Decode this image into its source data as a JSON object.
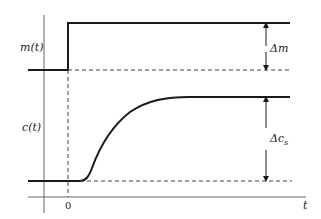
{
  "diagram": {
    "title": "",
    "type": "step-response",
    "colors": {
      "ink": "#1a1a1a",
      "axis": "#555555",
      "dash": "#444444",
      "background": "#ffffff"
    },
    "axes": {
      "x_label": "t",
      "origin_tick_label": "0"
    },
    "signals": [
      {
        "name": "input",
        "label": "m(t)",
        "shape": "step",
        "delta_label": "Δm"
      },
      {
        "name": "output",
        "label": "c(t)",
        "shape": "sigmoid-rise",
        "delta_label": "Δc",
        "delta_subscript": "s"
      }
    ]
  }
}
